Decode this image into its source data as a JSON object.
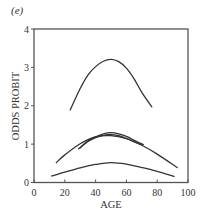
{
  "panel_label": "(e)",
  "chart_data": {
    "type": "line",
    "title": "",
    "xlabel": "AGE",
    "ylabel": "ODDS PROBIT",
    "xlim": [
      0,
      100
    ],
    "ylim": [
      0,
      4
    ],
    "xticks": [
      0,
      20,
      40,
      60,
      80,
      100
    ],
    "yticks": [
      0,
      1,
      2,
      3,
      4
    ],
    "grid": false,
    "legend": null,
    "line_color": "#333333",
    "axis_color": "#555555",
    "series": [
      {
        "name": "curve-top",
        "x": [
          23.5,
          30,
          35,
          40,
          45,
          50,
          55,
          60,
          65,
          70,
          76.5
        ],
        "y": [
          1.89,
          2.45,
          2.8,
          3.02,
          3.16,
          3.21,
          3.15,
          2.98,
          2.7,
          2.35,
          1.97
        ]
      },
      {
        "name": "curve-wide-middle",
        "x": [
          14.5,
          20,
          30,
          40,
          50,
          60,
          70,
          80,
          93
        ],
        "y": [
          0.52,
          0.72,
          1.01,
          1.19,
          1.22,
          1.14,
          0.97,
          0.74,
          0.39
        ]
      },
      {
        "name": "curve-cluster-outer",
        "x": [
          29,
          35,
          40,
          45,
          50,
          55,
          60,
          65,
          71
        ],
        "y": [
          0.88,
          1.08,
          1.19,
          1.27,
          1.3,
          1.27,
          1.2,
          1.1,
          0.99
        ]
      },
      {
        "name": "curve-cluster-inner",
        "x": [
          30,
          35,
          40,
          45,
          50,
          55,
          60,
          65,
          70
        ],
        "y": [
          0.9,
          1.07,
          1.17,
          1.23,
          1.25,
          1.22,
          1.15,
          1.06,
          0.98
        ]
      },
      {
        "name": "curve-bottom",
        "x": [
          11.5,
          20,
          30,
          40,
          50,
          60,
          70,
          80,
          91
        ],
        "y": [
          0.17,
          0.27,
          0.38,
          0.47,
          0.52,
          0.48,
          0.39,
          0.29,
          0.16
        ]
      }
    ]
  }
}
